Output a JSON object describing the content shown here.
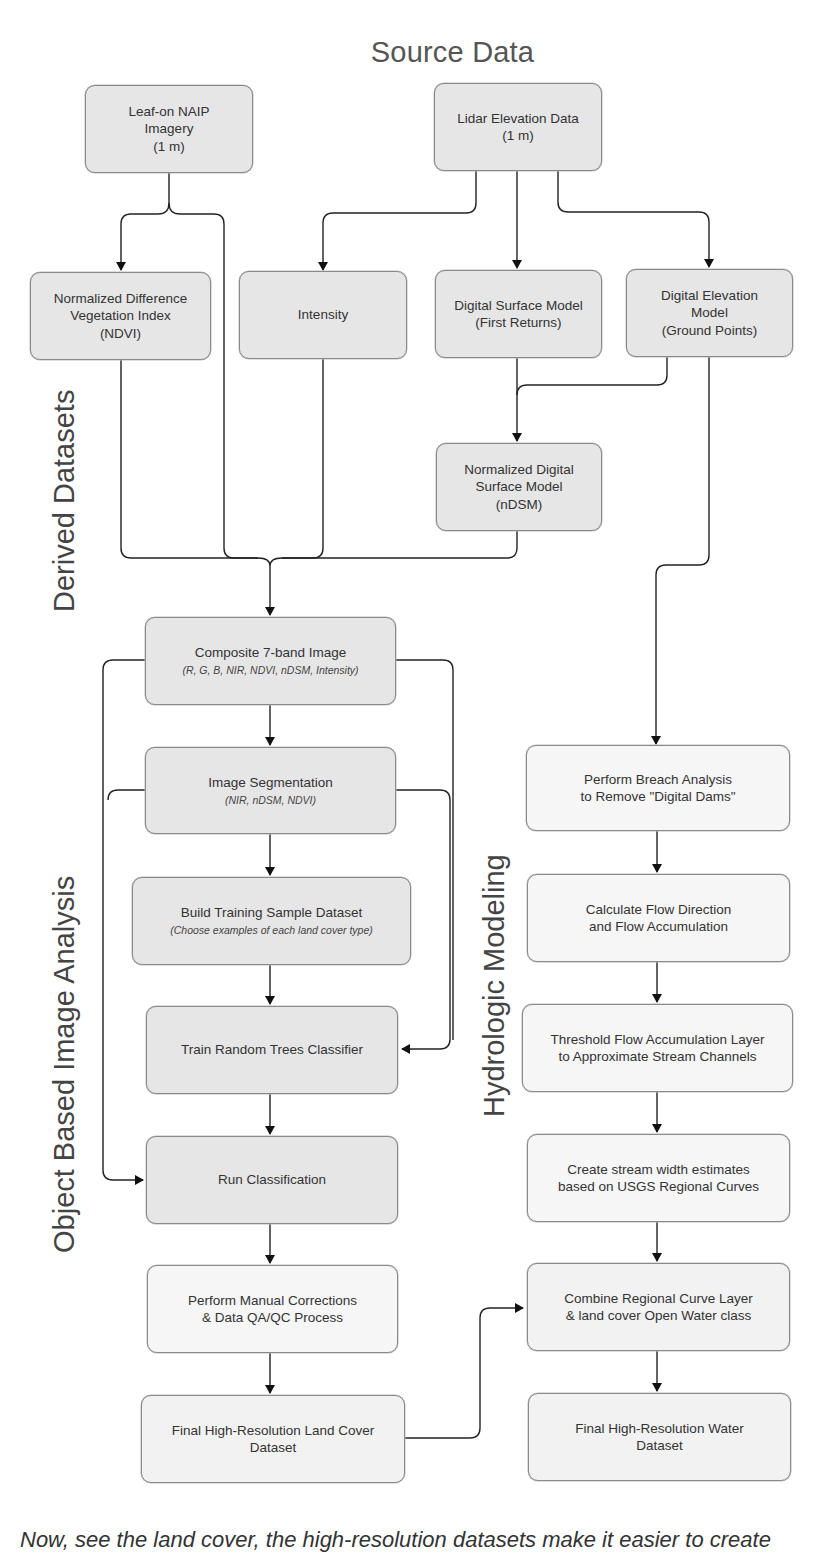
{
  "title": "Source Data",
  "section_labels": {
    "derived": "Derived Datasets",
    "obia": "Object Based Image Analysis",
    "hydro": "Hydrologic Modeling"
  },
  "source": {
    "naip": {
      "line1": "Leaf-on NAIP",
      "line2": "Imagery",
      "line3": "(1 m)"
    },
    "lidar": {
      "line1": "Lidar Elevation Data",
      "line2": "(1 m)"
    }
  },
  "derived": {
    "ndvi": {
      "line1": "Normalized Difference",
      "line2": "Vegetation Index",
      "line3": "(NDVI)"
    },
    "intensity": {
      "line1": "Intensity"
    },
    "dsm": {
      "line1": "Digital Surface Model",
      "line2": "(First Returns)"
    },
    "dem": {
      "line1": "Digital Elevation",
      "line2": "Model",
      "line3": "(Ground Points)"
    },
    "ndsm": {
      "line1": "Normalized Digital",
      "line2": "Surface Model",
      "line3": "(nDSM)"
    }
  },
  "obia": {
    "composite": {
      "line1": "Composite 7-band Image",
      "sub": "(R, G, B, NIR, NDVI, nDSM, Intensity)"
    },
    "segmentation": {
      "line1": "Image Segmentation",
      "sub": "(NIR, nDSM, NDVI)"
    },
    "training": {
      "line1": "Build Training Sample Dataset",
      "sub": "(Choose examples of each land cover type)"
    },
    "train_rt": {
      "line1": "Train Random Trees Classifier"
    },
    "run_class": {
      "line1": "Run Classification"
    },
    "manual": {
      "line1": "Perform Manual Corrections",
      "line2": "& Data QA/QC Process"
    },
    "final_lc": {
      "line1": "Final High-Resolution Land Cover",
      "line2": "Dataset"
    }
  },
  "hydro": {
    "breach": {
      "line1": "Perform Breach Analysis",
      "line2": "to Remove \"Digital Dams\""
    },
    "flow": {
      "line1": "Calculate Flow Direction",
      "line2": "and Flow Accumulation"
    },
    "threshold": {
      "line1": "Threshold Flow Accumulation Layer",
      "line2": "to Approximate Stream Channels"
    },
    "stream_width": {
      "line1": "Create stream width estimates",
      "line2": "based on USGS Regional Curves"
    },
    "combine": {
      "line1": "Combine Regional Curve Layer",
      "line2": "& land cover Open Water class"
    },
    "final_water": {
      "line1": "Final High-Resolution Water",
      "line2": "Dataset"
    }
  },
  "caption": "Now, see the land cover, the high-resolution datasets make it easier to create"
}
